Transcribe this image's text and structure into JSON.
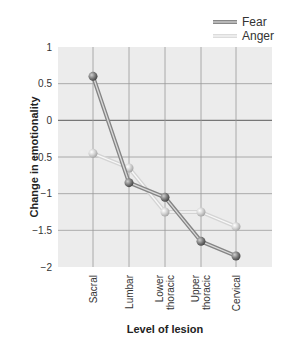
{
  "chart_data": {
    "type": "line",
    "title": "",
    "xlabel": "Level of lesion",
    "ylabel": "Change in emotionality",
    "categories": [
      "Sacral",
      "Lumbar",
      "Lower thoracic",
      "Upper thoracic",
      "Cervical"
    ],
    "category_lines": [
      [
        "Sacral"
      ],
      [
        "Lumbar"
      ],
      [
        "Lower",
        "thoracic"
      ],
      [
        "Upper",
        "thoracic"
      ],
      [
        "Cervical"
      ]
    ],
    "series": [
      {
        "name": "Fear",
        "values": [
          0.6,
          -0.85,
          -1.05,
          -1.65,
          -1.85
        ],
        "color": "#8a8a8a"
      },
      {
        "name": "Anger",
        "values": [
          -0.45,
          -0.65,
          -1.25,
          -1.25,
          -1.45
        ],
        "color": "#d6d6d6"
      }
    ],
    "yticks": [
      "1",
      "0.5",
      "0",
      "-0.5",
      "-1",
      "-1.5",
      "-2"
    ],
    "ytick_values": [
      1,
      0.5,
      0,
      -0.5,
      -1,
      -1.5,
      -2
    ],
    "ylim": [
      -2,
      1
    ],
    "grid": true,
    "legend_position": "top-right"
  },
  "legend": {
    "fear": "Fear",
    "anger": "Anger"
  },
  "axes": {
    "xlabel": "Level of lesion",
    "ylabel": "Change in emotionality"
  }
}
